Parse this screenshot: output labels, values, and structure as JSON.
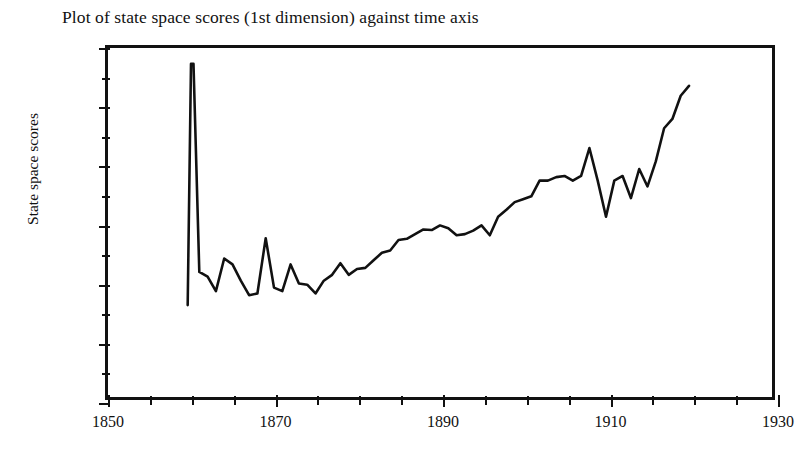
{
  "figure": {
    "title": "Plot of state space scores (1st dimension) against time axis",
    "line_color": "#111111",
    "axis_color": "#111111",
    "background": "#ffffff"
  },
  "axes": {
    "y_title": "State space scores",
    "x_title": "",
    "y_tick_labels": [
      "3.0",
      "2.0",
      "1.0",
      "0.0",
      "− 1.0",
      "− 2.0",
      "− 3.0"
    ],
    "y_tick_values": [
      3.0,
      2.0,
      1.0,
      0.0,
      -1.0,
      -2.0,
      -3.0
    ],
    "y_minor_tick_values": [
      2.5,
      1.5,
      0.5,
      -0.5,
      -1.5,
      -2.5
    ],
    "x_tick_labels": [
      "1850",
      "1870",
      "1890",
      "1910",
      "1930"
    ],
    "x_tick_values": [
      1850,
      1870,
      1890,
      1910,
      1930
    ],
    "x_minor_tick_values": [
      1855,
      1860,
      1865,
      1875,
      1880,
      1885,
      1895,
      1900,
      1905,
      1915,
      1920,
      1925
    ]
  },
  "chart_data": {
    "type": "line",
    "title": "Plot of state space scores (1st dimension) against time axis",
    "xlabel": "",
    "ylabel": "State space scores",
    "xlim": [
      1850,
      1930
    ],
    "ylim": [
      -3.0,
      3.0
    ],
    "grid": false,
    "legend": "none",
    "series": [
      {
        "name": "State space score (1st dimension)",
        "x": [
          1859.6,
          1860.0,
          1860.3,
          1861.0,
          1862.0,
          1863.0,
          1864.0,
          1865.0,
          1866.0,
          1867.0,
          1868.0,
          1869.0,
          1870.0,
          1871.0,
          1872.0,
          1873.0,
          1874.0,
          1875.0,
          1876.0,
          1877.0,
          1878.0,
          1879.0,
          1880.0,
          1881.0,
          1882.0,
          1883.0,
          1884.0,
          1885.0,
          1886.0,
          1887.0,
          1888.0,
          1889.0,
          1890.0,
          1891.0,
          1892.0,
          1893.0,
          1894.0,
          1895.0,
          1896.0,
          1897.0,
          1898.0,
          1899.0,
          1900.0,
          1901.0,
          1902.0,
          1903.0,
          1904.0,
          1905.0,
          1906.0,
          1907.0,
          1908.0,
          1909.0,
          1910.0,
          1911.0,
          1912.0,
          1913.0,
          1914.0,
          1915.0,
          1916.0,
          1917.0,
          1918.0,
          1919.0,
          1920.0
        ],
        "y": [
          -1.42,
          2.73,
          2.73,
          -0.85,
          -0.93,
          -1.18,
          -0.62,
          -0.72,
          -1.0,
          -1.25,
          -1.22,
          -0.27,
          -1.12,
          -1.18,
          -0.72,
          -1.05,
          -1.07,
          -1.22,
          -1.0,
          -0.9,
          -0.7,
          -0.9,
          -0.8,
          -0.78,
          -0.65,
          -0.52,
          -0.48,
          -0.3,
          -0.28,
          -0.2,
          -0.12,
          -0.13,
          -0.05,
          -0.1,
          -0.22,
          -0.2,
          -0.14,
          -0.05,
          -0.22,
          0.1,
          0.22,
          0.35,
          0.4,
          0.45,
          0.72,
          0.72,
          0.78,
          0.8,
          0.72,
          0.8,
          1.28,
          0.72,
          0.1,
          0.72,
          0.8,
          0.42,
          0.92,
          0.62,
          1.05,
          1.62,
          1.78,
          2.18,
          2.35
        ]
      }
    ]
  }
}
